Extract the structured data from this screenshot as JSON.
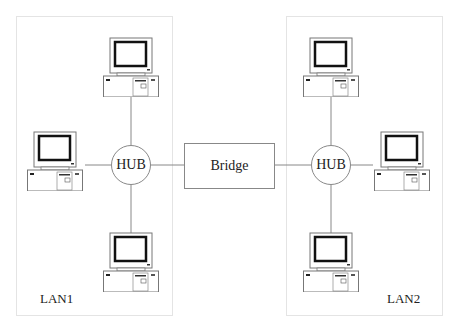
{
  "diagram": {
    "lans": [
      {
        "label": "LAN1"
      },
      {
        "label": "LAN2"
      }
    ],
    "hubs": [
      {
        "label": "HUB"
      },
      {
        "label": "HUB"
      }
    ],
    "bridge": {
      "label": "Bridge"
    },
    "computers_per_lan": 3,
    "colors": {
      "line": "#888888",
      "lan_border": "#e4e4e4",
      "text": "#222222"
    }
  }
}
